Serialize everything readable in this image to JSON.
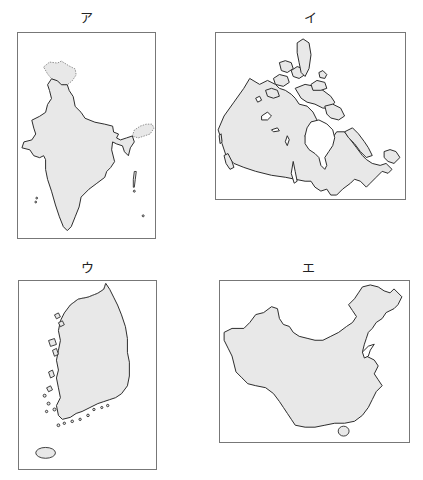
{
  "figure": {
    "panels": [
      {
        "id": "a",
        "label": "ア",
        "country_depicted": "India"
      },
      {
        "id": "i",
        "label": "イ",
        "country_depicted": "Canada"
      },
      {
        "id": "u",
        "label": "ウ",
        "country_depicted": "South Korea"
      },
      {
        "id": "e",
        "label": "エ",
        "country_depicted": "China"
      }
    ],
    "colors": {
      "land_fill": "#e8e8e8",
      "outline": "#2a2a2a",
      "frame": "#777777",
      "background": "#ffffff"
    }
  }
}
